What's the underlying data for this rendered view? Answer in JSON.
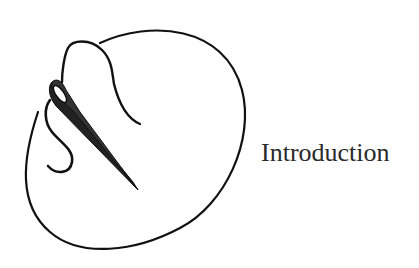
{
  "page": {
    "title": "Introduction"
  },
  "illustration": {
    "subject": "needle-and-thread-icon",
    "stroke_color": "#111111"
  }
}
